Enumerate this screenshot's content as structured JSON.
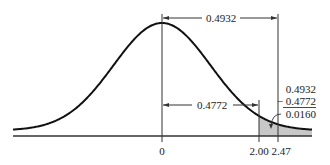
{
  "diagram": {
    "type": "normal-curve-area",
    "z_values": [
      0,
      2.0,
      2.47
    ],
    "shaded_region": {
      "from": 2.0,
      "to": 2.47
    },
    "colors": {
      "curve": "#111111",
      "shade": "#c8c8c8",
      "line": "#333333"
    },
    "labels": {
      "area_0_to_247": "0.4932",
      "area_0_to_200": "0.4772",
      "tick_0": "0",
      "tick_200": "2.00",
      "tick_247": "2.47",
      "calc_top": "0.4932",
      "calc_sub": "− 0.4772",
      "calc_result": "0.0160"
    }
  }
}
